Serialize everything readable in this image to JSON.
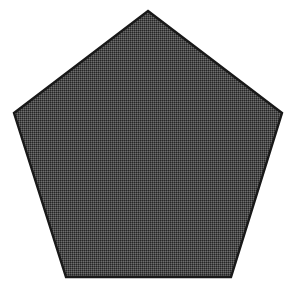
{
  "image": {
    "width": 295,
    "height": 297,
    "background_color": "#ffffff",
    "subject_name": "regular-pentagon",
    "description": "A single large solid dark-gray pentagon centered on a plain white background, drawn with a thin near-black outline and filled with a fine checkerboard dither (halftone) texture."
  },
  "shape": {
    "kind": "polygon",
    "sides": 5,
    "label": "pentagon",
    "orientation": "apex-up",
    "fill_color": "#4a4a4a",
    "dither_dark_color": "#262626",
    "dither_light_color": "#6e6e6e",
    "stroke_color": "#191919",
    "stroke_width": 2.4,
    "points_string": "148,11 282,113 231,277 66,277 14,113",
    "vertices": [
      {
        "name": "apex-top",
        "x": 148,
        "y": 11
      },
      {
        "name": "right-upper",
        "x": 282,
        "y": 113
      },
      {
        "name": "right-lower",
        "x": 231,
        "y": 277
      },
      {
        "name": "left-lower",
        "x": 66,
        "y": 277
      },
      {
        "name": "left-upper",
        "x": 14,
        "y": 113
      }
    ],
    "bounding_box": {
      "x": 14,
      "y": 11,
      "width": 268,
      "height": 266
    },
    "centroid": {
      "x": 148,
      "y": 158
    }
  }
}
